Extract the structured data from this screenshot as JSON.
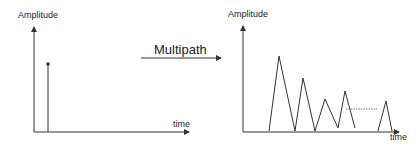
{
  "left_plot": {
    "y_label": "Amplitude",
    "x_label": "time",
    "impulse": {
      "x": 48,
      "top": 64
    }
  },
  "arrow": {
    "label": "Multipath"
  },
  "right_plot": {
    "y_label": "Amplitude",
    "x_label": "time",
    "peaks_points": "269,131 279,56 295,131 303,78 315,131 325,99 338,128 345,91 355,128",
    "tail_points": "378,131 386,101 392,131"
  },
  "colors": {
    "line": "#333333",
    "dash": "#555555"
  }
}
